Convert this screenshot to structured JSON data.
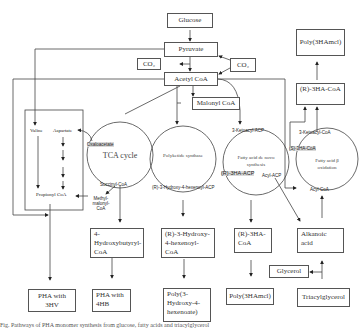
{
  "diagram": {
    "boxes": {
      "glucose": "Glucose",
      "pyruvate": "Pyruvate",
      "co2_left": "CO₂",
      "co2_right": "CO₂",
      "acetyl_coa": "Acetyl CoA",
      "malonyl_coa": "Malonyl CoA",
      "r3ha_coa_top": "(R)-3HA-CoA",
      "poly3ha_top": "Poly(3HAmcl)",
      "hydroxybutyryl": "4-Hydroxybutyryl-CoA",
      "hydroxyhexenoyl": "(R)-3-Hydroxy-4-hexenoyl-CoA",
      "r3ha_coa_bottom": "(R)-3HA-CoA",
      "alkanoic_acid": "Alkanoic acid",
      "glycerol": "Glycerol",
      "triacylglycerol": "Triacylglycerol",
      "pha_3hv": "PHA with 3HV",
      "pha_4hb": "PHA with 4HB",
      "poly_hydroxyhexenoate": "Poly(3-Hydroxy-4-hexenoate)",
      "poly3ha_bottom": "Poly(3HAmcl)"
    },
    "cycles": {
      "tca": "TCA cycle",
      "polyketide": "Polyketide synthase",
      "fa_denovo": "Fatty acid de novo synthesis",
      "fa_beta": "Fatty acid β oxidation"
    },
    "labels": {
      "valine": "Valine",
      "aspartate": "Aspartate",
      "propionyl_coa": "Propionyl CoA",
      "oxaloacetate": "Oxaloacetate",
      "succinyl_coa": "Succinyl-CoA",
      "methylmalonyl_coa": "Methyl-malonyl-CoA",
      "r3_hydroxy_hexenoyl_acp": "(R)-3-Hydroxy-4-hexenoyl-ACP",
      "ketoacyl_acp": "3-Ketoacyl-ACP",
      "r3ha_acp": "(R)-3HA-ACP",
      "acyl_acp": "Acyl-ACP",
      "ketoacyl_coa": "3-Ketoacyl-CoA",
      "s3ha_coa": "(S)-3HA-CoA",
      "acyl_coa": "Acyl-CoA"
    }
  },
  "caption": "Fig. Pathways of PHA monomer synthesis from glucose, fatty acids and triacylglycerol"
}
